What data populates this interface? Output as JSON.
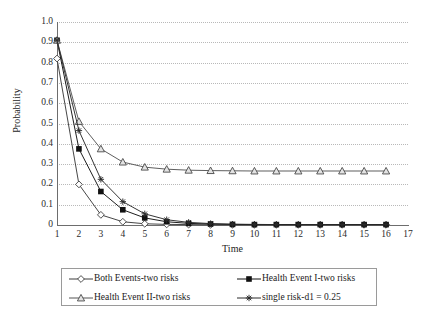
{
  "chart_data": {
    "type": "line",
    "title": "",
    "xlabel": "Time",
    "ylabel": "Probability",
    "xlim": [
      1,
      17
    ],
    "ylim": [
      0,
      1.0
    ],
    "grid": true,
    "legend_position": "bottom",
    "x": [
      1,
      2,
      3,
      4,
      5,
      6,
      7,
      8,
      9,
      10,
      11,
      12,
      13,
      14,
      15,
      16
    ],
    "xticks": [
      "1",
      "2",
      "3",
      "4",
      "5",
      "6",
      "7",
      "8",
      "9",
      "10",
      "11",
      "12",
      "13",
      "14",
      "15",
      "16",
      "17"
    ],
    "yticks": [
      "0",
      "0.1",
      "0.2",
      "0.3",
      "0.4",
      "0.5",
      "0.6",
      "0.7",
      "0.8",
      "0.9",
      "1.0"
    ],
    "series": [
      {
        "name": "Both Events-two risks",
        "marker": "hollow-diamond",
        "color": "#3c3c3c",
        "values": [
          0.82,
          0.2,
          0.05,
          0.016,
          0.006,
          0.003,
          0.002,
          0.001,
          0.001,
          0.001,
          0.001,
          0.001,
          0.001,
          0.001,
          0.001,
          0.001
        ]
      },
      {
        "name": "Health Event I-two risks",
        "marker": "filled-square",
        "color": "#111111",
        "values": [
          0.91,
          0.375,
          0.165,
          0.075,
          0.035,
          0.016,
          0.008,
          0.005,
          0.003,
          0.002,
          0.002,
          0.002,
          0.002,
          0.002,
          0.002,
          0.002
        ]
      },
      {
        "name": "Health Event II-two risks",
        "marker": "hollow-triangle",
        "color": "#555555",
        "values": [
          0.91,
          0.51,
          0.375,
          0.31,
          0.285,
          0.275,
          0.27,
          0.268,
          0.267,
          0.266,
          0.266,
          0.266,
          0.266,
          0.266,
          0.266,
          0.266
        ]
      },
      {
        "name": "single risk-d1 = 0.25",
        "marker": "asterisk",
        "color": "#2a2a2a",
        "values": [
          0.91,
          0.465,
          0.225,
          0.115,
          0.055,
          0.026,
          0.013,
          0.007,
          0.004,
          0.003,
          0.002,
          0.002,
          0.002,
          0.002,
          0.002,
          0.002
        ]
      }
    ]
  },
  "legend": {
    "entries": [
      {
        "label": "Both Events-two risks",
        "marker": "hollow-diamond"
      },
      {
        "label": "Health Event I-two risks",
        "marker": "filled-square"
      },
      {
        "label": "Health Event II-two risks",
        "marker": "hollow-triangle"
      },
      {
        "label": "single risk-d1 = 0.25",
        "marker": "asterisk"
      }
    ]
  }
}
